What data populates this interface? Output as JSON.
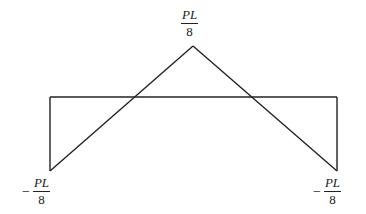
{
  "diagram": {
    "type": "bending moment diagram",
    "labels": {
      "top": {
        "numerator": "PL",
        "denominator": "8"
      },
      "left": {
        "sign": "−",
        "numerator": "PL",
        "denominator": "8"
      },
      "right": {
        "sign": "−",
        "numerator": "PL",
        "denominator": "8"
      }
    },
    "stroke_color": "#222222"
  }
}
